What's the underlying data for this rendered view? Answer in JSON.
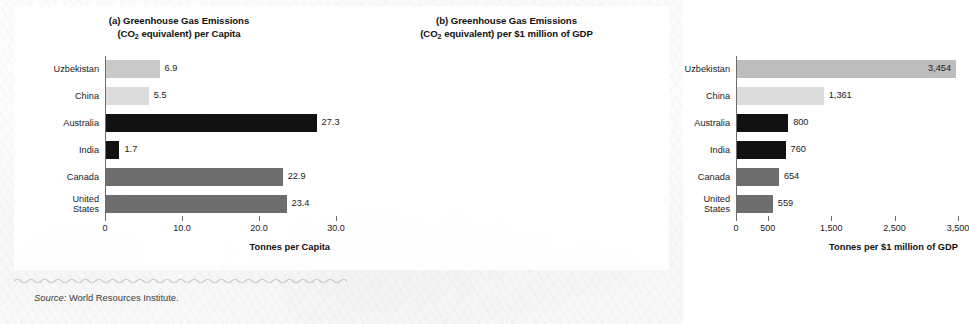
{
  "figure": {
    "source_label": "Source:",
    "source_text": "World Resources Institute."
  },
  "chart_data": [
    {
      "type": "bar",
      "orientation": "horizontal",
      "panel": "(a)",
      "title": "(a) Greenhouse Gas Emissions",
      "title_line2_pre": "(CO",
      "title_line2_sub": "2",
      "title_line2_post": " equivalent) per Capita",
      "xlabel": "Tonnes per Capita",
      "ylabel": "",
      "xlim": [
        0,
        30
      ],
      "xticks": [
        0,
        10,
        20,
        30
      ],
      "xticklabels": [
        "0",
        "10.0",
        "20.0",
        "30.0"
      ],
      "grid": false,
      "legend": "none",
      "categories": [
        "Uzbekistan",
        "China",
        "Australia",
        "India",
        "Canada",
        "United\nStates"
      ],
      "values": [
        6.9,
        5.5,
        27.3,
        1.7,
        22.9,
        23.4
      ],
      "value_labels": [
        "6.9",
        "5.5",
        "27.3",
        "1.7",
        "22.9",
        "23.4"
      ],
      "bar_colors": [
        "#c9c9c9",
        "#dcdcdc",
        "#111111",
        "#111111",
        "#6e6e6e",
        "#6e6e6e"
      ],
      "label_placement": [
        "outside",
        "outside",
        "outside",
        "outside",
        "outside",
        "outside"
      ]
    },
    {
      "type": "bar",
      "orientation": "horizontal",
      "panel": "(b)",
      "title": "(b) Greenhouse Gas Emissions",
      "title_line2_pre": "(CO",
      "title_line2_sub": "2",
      "title_line2_post": " equivalent) per $1 million of GDP",
      "xlabel": "Tonnes per $1 million of GDP",
      "ylabel": "",
      "xlim": [
        0,
        3500
      ],
      "xticks": [
        0,
        500,
        1500,
        2500,
        3500
      ],
      "xticklabels": [
        "0",
        "500",
        "1,500",
        "2,500",
        "3,500"
      ],
      "grid": false,
      "legend": "none",
      "categories": [
        "Uzbekistan",
        "China",
        "Australia",
        "India",
        "Canada",
        "United\nStates"
      ],
      "values": [
        3454,
        1361,
        800,
        760,
        654,
        559
      ],
      "value_labels": [
        "3,454",
        "1,361",
        "800",
        "760",
        "654",
        "559"
      ],
      "bar_colors": [
        "#bdbdbd",
        "#dcdcdc",
        "#111111",
        "#111111",
        "#6e6e6e",
        "#6e6e6e"
      ],
      "label_placement": [
        "inside",
        "outside",
        "outside",
        "outside",
        "outside",
        "outside"
      ]
    }
  ]
}
